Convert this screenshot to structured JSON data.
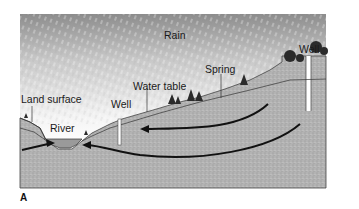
{
  "diagram": {
    "panel": "A",
    "labels": {
      "rain": "Rain",
      "well_right": "Well",
      "spring": "Spring",
      "water_table": "Water table",
      "well_left": "Well",
      "land_surface": "Land surface",
      "river": "River"
    },
    "colors": {
      "sky_top": "#8a8a8a",
      "sky_bottom": "#ffffff",
      "ground": "#b5b5b5",
      "ground_saturated": "#a9a9a9",
      "river_water": "#9a9a9a",
      "outline": "#333333",
      "arrow": "#111111",
      "tree": "#2b2b2b"
    },
    "flow_arrows": [
      {
        "from": "hill-right",
        "to": "river",
        "direction": "left"
      },
      {
        "from": "hill-right-deep",
        "to": "river",
        "direction": "left"
      },
      {
        "from": "left-margin",
        "to": "river",
        "direction": "right"
      }
    ]
  }
}
